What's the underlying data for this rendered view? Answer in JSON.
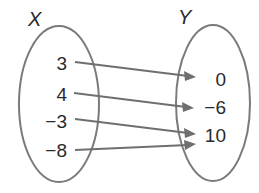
{
  "diagram": {
    "type": "mapping-diagram",
    "domain_set": {
      "label": "X",
      "values": [
        "3",
        "4",
        "−3",
        "−8"
      ]
    },
    "range_set": {
      "label": "Y",
      "values": [
        "0",
        "−6",
        "10"
      ]
    },
    "mappings": [
      {
        "from": "3",
        "to": "0"
      },
      {
        "from": "4",
        "to": "−6"
      },
      {
        "from": "−3",
        "to": "10"
      },
      {
        "from": "−8",
        "to": "10"
      }
    ],
    "colors": {
      "oval_stroke": "#7a7a7a",
      "arrow": "#6f6f6f",
      "text": "#2a2a2a"
    }
  }
}
